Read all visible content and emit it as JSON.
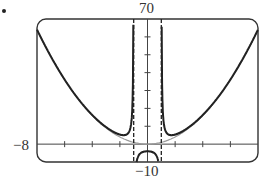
{
  "chart_data": {
    "type": "line",
    "title": "",
    "xlabel": "",
    "ylabel": "",
    "xlim": [
      -8,
      8
    ],
    "ylim": [
      -10,
      70
    ],
    "x_tick_step": 2,
    "y_tick_step": 10,
    "window_labels": {
      "top": "70",
      "bottom": "-10",
      "left": "-8"
    },
    "series": [
      {
        "name": "f(x)",
        "style": "solid-dark",
        "description": "rational function with vertical asymptotes at x = -1 and x = 1"
      },
      {
        "name": "slant/parabolic asymptote y = x^2",
        "style": "solid-gray"
      },
      {
        "name": "vertical asymptotes",
        "style": "dashed",
        "x": [
          -1,
          1
        ]
      }
    ]
  },
  "labels": {
    "top": "70",
    "bottom": "−10",
    "left": "−8"
  }
}
